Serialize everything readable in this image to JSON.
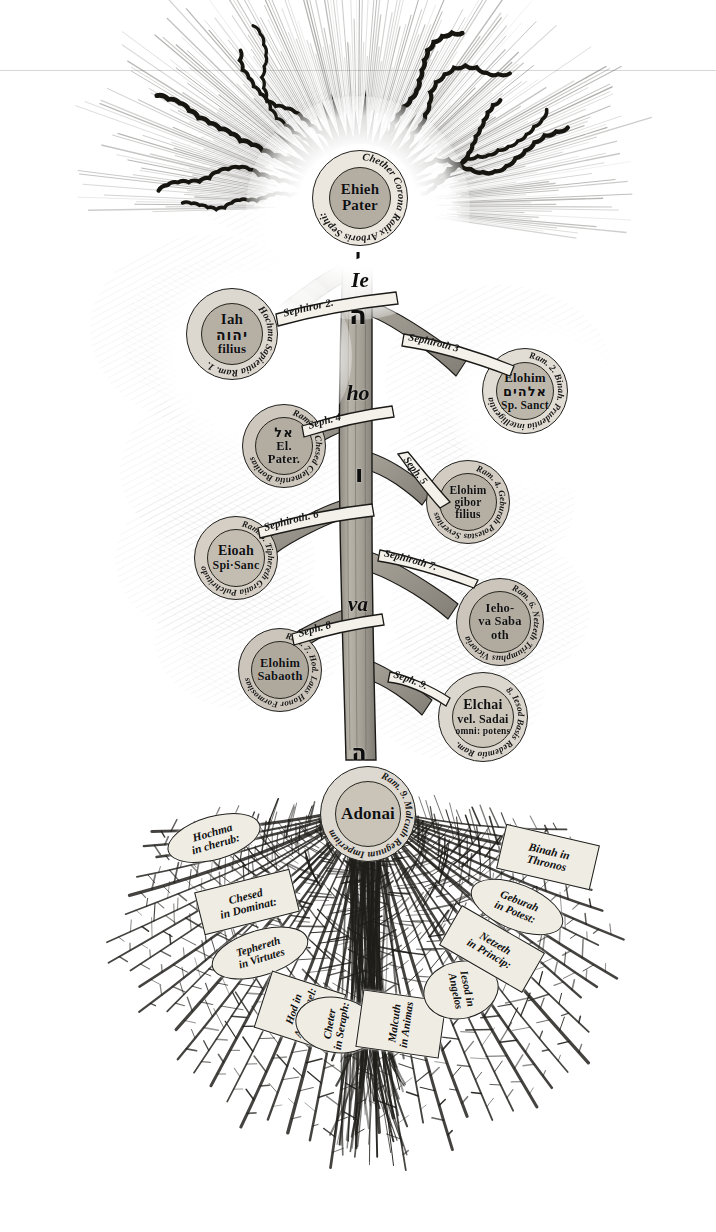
{
  "plate": {
    "title": "Arbor Sephirotica — Inverted Tree of Life",
    "background_color": "#ffffff",
    "ink_color": "#141414",
    "node_fill": "#c6c0b6",
    "tag_fill": "#efece4"
  },
  "trunk": {
    "name": "Tetragrammaton trunk",
    "glyphs": [
      {
        "id": "yod",
        "script": "hebrew",
        "text": "י"
      },
      {
        "id": "ie",
        "script": "latin",
        "text": "Ie"
      },
      {
        "id": "he1",
        "script": "hebrew",
        "text": "ה"
      },
      {
        "id": "ho",
        "script": "latin",
        "text": "ho"
      },
      {
        "id": "vav",
        "script": "hebrew",
        "text": "ו"
      },
      {
        "id": "va",
        "script": "latin",
        "text": "va"
      },
      {
        "id": "he2",
        "script": "hebrew",
        "text": "ה"
      }
    ]
  },
  "sephirot": [
    {
      "num": "1",
      "name": "Chether",
      "ring_text": "Chether Corona Radix Arboris Sephi:",
      "core": [
        "Ehieh",
        "Pater"
      ],
      "hebrew": "",
      "branch_label": ""
    },
    {
      "num": "2",
      "name": "Hochma",
      "ring_text": "Hochma Sapientia Ram. 1.",
      "core": [
        "Iah",
        "filius"
      ],
      "hebrew": "יהוה",
      "branch_label": "Sephiror 2."
    },
    {
      "num": "3",
      "name": "Binah",
      "ring_text": "Ram. 2. Binah. Prudentia intelligentia",
      "core": [
        "Elohim",
        "Sp. Sanct"
      ],
      "hebrew": "אלהים",
      "branch_label": "Sephiroth 3"
    },
    {
      "num": "4",
      "name": "Chesed",
      "ring_text": "Ram. 3. Chesed Clementia Bonitas",
      "core": [
        "El.",
        "Pater."
      ],
      "hebrew": "אל",
      "branch_label": "Seph. 4"
    },
    {
      "num": "5",
      "name": "Geburah",
      "ring_text": "Ram. 4. Geburah Potestas Severitas",
      "core": [
        "Elohim",
        "gibor",
        "filius"
      ],
      "hebrew": "",
      "branch_label": "Seph. 5"
    },
    {
      "num": "6",
      "name": "Tiphereth",
      "ring_text": "Ram. 5. Tiphereth Gratia Pulchritudo",
      "core": [
        "Eioah",
        "Spi·Sanc"
      ],
      "hebrew": "",
      "branch_label": "Sephiroth. 6"
    },
    {
      "num": "7",
      "name": "Netzeth",
      "ring_text": "Ram. 6. Netzeth Triumphus Victoria",
      "core": [
        "Ieho-",
        "va Saba",
        "oth"
      ],
      "hebrew": "",
      "branch_label": "Sephiroth 7."
    },
    {
      "num": "8",
      "name": "Hod",
      "ring_text": "Ram. 7. Hod. Laus Honor Formositas",
      "core": [
        "Elohim",
        "Sabaoth"
      ],
      "hebrew": "",
      "branch_label": "Seph. 8"
    },
    {
      "num": "9",
      "name": "Iesod",
      "ring_text": "8. Iesod Basis Redemtio Ram.",
      "core": [
        "Elchai",
        "vel. Sadai",
        "omni: potens"
      ],
      "hebrew": "",
      "branch_label": "Seph. 9."
    },
    {
      "num": "10",
      "name": "Malcuth",
      "ring_text": "Ram. 9. Malcuth Regnum Imperium",
      "core": [
        "Adonai"
      ],
      "hebrew": "",
      "branch_label": ""
    }
  ],
  "roots": [
    {
      "id": "hochma-cherub",
      "lines": [
        "Hochma",
        "in cherub:"
      ],
      "shape": "oval"
    },
    {
      "id": "chesed-dominat",
      "lines": [
        "Chesed",
        "in Dominat:"
      ],
      "shape": "rect"
    },
    {
      "id": "tephereth-virt",
      "lines": [
        "Tephereth",
        "in Virtutes"
      ],
      "shape": "oval"
    },
    {
      "id": "hod-archangel",
      "lines": [
        "Hod in",
        "Archangel:"
      ],
      "shape": "rect"
    },
    {
      "id": "cheter-seraph",
      "lines": [
        "Cheter",
        "in Seraph:"
      ],
      "shape": "oval"
    },
    {
      "id": "malcuth-animas",
      "lines": [
        "Malcuth",
        "in Animas"
      ],
      "shape": "rect"
    },
    {
      "id": "iesod-angelos",
      "lines": [
        "Iesod in",
        "Angelos"
      ],
      "shape": "oval"
    },
    {
      "id": "netzeth-princip",
      "lines": [
        "Netzeth",
        "in Princip:"
      ],
      "shape": "rect"
    },
    {
      "id": "geburah-potest",
      "lines": [
        "Geburah",
        "in Potest:"
      ],
      "shape": "oval"
    },
    {
      "id": "binah-thronos",
      "lines": [
        "Binah in",
        "Thronos"
      ],
      "shape": "rect"
    }
  ]
}
